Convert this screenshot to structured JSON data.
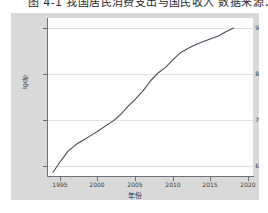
{
  "caption": {
    "text": "图 4-1  我国居民消费支出与国民收入  数据来源：国"
  },
  "axes": {
    "y_title": "lgdp",
    "x_title": "年份",
    "y_ticks": [
      "9",
      "8",
      "7",
      "6"
    ],
    "y_tick_values": [
      9,
      8,
      7,
      6
    ],
    "x_ticks": [
      "1995",
      "2000",
      "2005",
      "2010",
      "2015",
      "2020"
    ],
    "x_tick_values": [
      1995,
      2000,
      2005,
      2010,
      2015,
      2020
    ]
  },
  "colors": {
    "panel_background": "#d9d9d9",
    "plot_background": "#fefefe",
    "grid": "#e2e2e2",
    "axis": "#6f6f78",
    "line": "#4a4a5c"
  },
  "chart_data": {
    "type": "line",
    "title": "",
    "xlabel": "年份",
    "ylabel": "lgdp",
    "xlim": [
      1993.2,
      2020.6
    ],
    "ylim": [
      5.78,
      9.22
    ],
    "grid": true,
    "legend": "none",
    "series": [
      {
        "name": "lgdp",
        "x": [
          1994,
          1995,
          1996,
          1997,
          1998,
          1999,
          2000,
          2001,
          2002,
          2003,
          2004,
          2005,
          2006,
          2007,
          2008,
          2009,
          2010,
          2011,
          2012,
          2013,
          2014,
          2015,
          2016,
          2017,
          2018
        ],
        "values": [
          5.86,
          6.1,
          6.32,
          6.46,
          6.56,
          6.66,
          6.76,
          6.87,
          6.98,
          7.12,
          7.3,
          7.46,
          7.64,
          7.86,
          8.03,
          8.15,
          8.32,
          8.47,
          8.56,
          8.64,
          8.71,
          8.77,
          8.83,
          8.92,
          9.0
        ]
      }
    ]
  }
}
